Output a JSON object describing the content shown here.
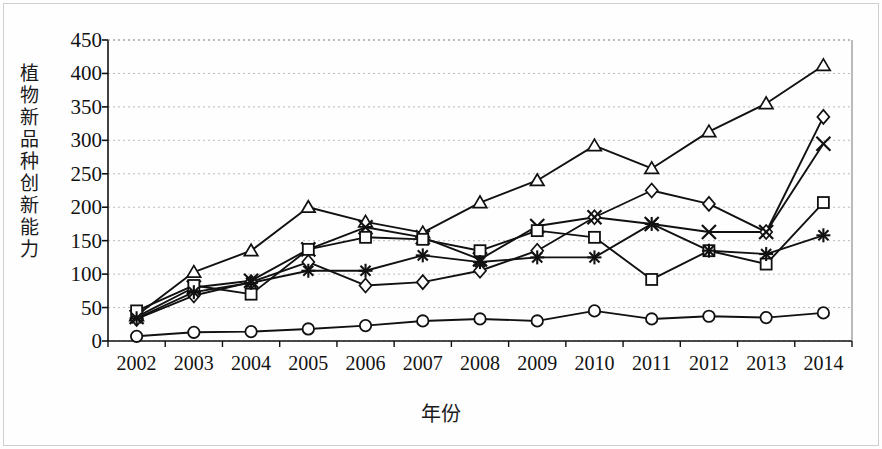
{
  "chart_data": {
    "type": "line",
    "title": "",
    "xlabel": "年份",
    "ylabel": "植物新品种创新能力",
    "categories": [
      "2002",
      "2003",
      "2004",
      "2005",
      "2006",
      "2007",
      "2008",
      "2009",
      "2010",
      "2011",
      "2012",
      "2013",
      "2014"
    ],
    "ylim": [
      0,
      450
    ],
    "ytick_labels": [
      "0",
      "50",
      "100",
      "150",
      "200",
      "250",
      "300",
      "350",
      "400",
      "450"
    ],
    "ytick_values": [
      0,
      50,
      100,
      150,
      200,
      250,
      300,
      350,
      400,
      450
    ],
    "grid": true,
    "grid_style": "dotted-horizontal",
    "legend": "none",
    "line_color": "#111111",
    "marker_fill": "#ffffff",
    "series": [
      {
        "name": "series-triangle",
        "marker": "triangle",
        "values": [
          38,
          103,
          135,
          200,
          178,
          162,
          207,
          240,
          292,
          258,
          313,
          355,
          412
        ]
      },
      {
        "name": "series-diamond",
        "marker": "diamond",
        "values": [
          33,
          68,
          88,
          118,
          83,
          88,
          105,
          135,
          185,
          225,
          205,
          163,
          335
        ]
      },
      {
        "name": "series-cross-x",
        "marker": "cross-x",
        "values": [
          36,
          80,
          90,
          137,
          170,
          155,
          122,
          172,
          185,
          175,
          163,
          163,
          295
        ]
      },
      {
        "name": "series-square",
        "marker": "square",
        "values": [
          45,
          83,
          70,
          137,
          155,
          152,
          135,
          165,
          155,
          92,
          135,
          115,
          207
        ]
      },
      {
        "name": "series-asterisk",
        "marker": "asterisk",
        "values": [
          34,
          73,
          87,
          105,
          105,
          128,
          118,
          125,
          125,
          175,
          135,
          130,
          158
        ]
      },
      {
        "name": "series-circle",
        "marker": "circle",
        "values": [
          7,
          13,
          14,
          18,
          23,
          30,
          33,
          30,
          45,
          33,
          37,
          35,
          42
        ]
      }
    ]
  },
  "axes": {
    "y_label_chars": "植物新品种创新能力",
    "x_label": "年份"
  }
}
